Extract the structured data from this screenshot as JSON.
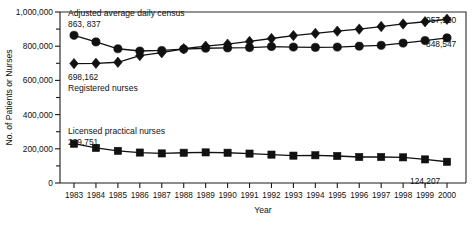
{
  "chart_data": {
    "type": "line",
    "title": "",
    "xlabel": "Year",
    "ylabel": "No. of Patients or Nurses",
    "xlim": [
      1983,
      2000
    ],
    "ylim": [
      0,
      1000000
    ],
    "grid": false,
    "legend_position": "inline-annotations",
    "categories": [
      "1983",
      "1984",
      "1985",
      "1986",
      "1987",
      "1988",
      "1989",
      "1990",
      "1991",
      "1992",
      "1993",
      "1994",
      "1995",
      "1996",
      "1997",
      "1998",
      "1999",
      "2000"
    ],
    "ytick_labels": [
      "0",
      "200,000",
      "400,000",
      "600,000",
      "800,000",
      "1,000,000"
    ],
    "ytick_values": [
      0,
      200000,
      400000,
      600000,
      800000,
      1000000
    ],
    "yminor_tick_values": [
      100000,
      300000,
      500000,
      700000,
      900000
    ],
    "series": [
      {
        "name": "Adjusted average daily census",
        "marker": "circle",
        "values": [
          863837,
          825000,
          785000,
          772000,
          775000,
          783000,
          788000,
          790000,
          792000,
          798000,
          795000,
          793000,
          795000,
          800000,
          805000,
          818000,
          833000,
          848547
        ]
      },
      {
        "name": "Registered nurses",
        "marker": "diamond",
        "values": [
          698162,
          700000,
          706000,
          745000,
          762000,
          785000,
          800000,
          812000,
          828000,
          845000,
          862000,
          875000,
          888000,
          900000,
          915000,
          930000,
          943000,
          957550
        ]
      },
      {
        "name": "Licensed practical nurses",
        "marker": "square",
        "values": [
          229751,
          205000,
          188000,
          178000,
          173000,
          177000,
          179000,
          177000,
          172000,
          166000,
          160000,
          162000,
          158000,
          152000,
          152000,
          150000,
          138000,
          124207
        ]
      }
    ],
    "annotations": [
      {
        "id": "census-series-label",
        "text": "Adjusted average daily census",
        "x_px": 68,
        "y_px": 16
      },
      {
        "id": "census-start-value",
        "text": "863, 837",
        "x_px": 68,
        "y_px": 27
      },
      {
        "id": "rn-start-value",
        "text": "698,162",
        "x_px": 68,
        "y_px": 80
      },
      {
        "id": "rn-series-label",
        "text": "Registered nurses",
        "x_px": 68,
        "y_px": 91
      },
      {
        "id": "lpn-series-label",
        "text": "Licensed practical nurses",
        "x_px": 68,
        "y_px": 134
      },
      {
        "id": "lpn-start-value",
        "text": "229,751",
        "x_px": 68,
        "y_px": 145
      },
      {
        "id": "rn-end-value",
        "text": "957,550",
        "x_px": 426,
        "y_px": 23
      },
      {
        "id": "census-end-value",
        "text": "848,547",
        "x_px": 426,
        "y_px": 47
      },
      {
        "id": "lpn-end-value",
        "text": "124,207",
        "x_px": 410,
        "y_px": 184
      }
    ],
    "colors": {
      "line": "#111111",
      "marker": "#111111",
      "axis": "#1a1a1a",
      "background": "#ffffff"
    }
  }
}
